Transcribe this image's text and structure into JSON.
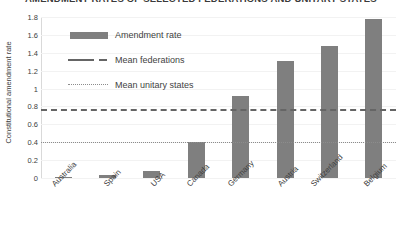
{
  "chart_data": {
    "type": "bar",
    "title": "AMENDMENT RATES OF SELECTED FEDERATIONS AND UNITARY STATES",
    "xlabel": "",
    "ylabel": "Constitutional amendment rate",
    "ylim": [
      0,
      1.8
    ],
    "ytick_labels": [
      "1.8",
      "1.6",
      "1.4",
      "1.2",
      "1",
      "0.8",
      "0.6",
      "0.4",
      "0.2",
      "0"
    ],
    "ytick_values": [
      1.8,
      1.6,
      1.4,
      1.2,
      1.0,
      0.8,
      0.6,
      0.4,
      0.2,
      0
    ],
    "grid": true,
    "legend_position": "upper-left-inside",
    "categories": [
      "Australia",
      "Spain",
      "USA",
      "Canada",
      "Germany",
      "Austria",
      "Switzerland",
      "Belgium"
    ],
    "values": [
      0.01,
      0.03,
      0.08,
      0.4,
      0.92,
      1.31,
      1.48,
      1.78
    ],
    "series": [
      {
        "name": "Amendment rate",
        "type": "bar",
        "color": "#7f7f7f",
        "values": [
          0.01,
          0.03,
          0.08,
          0.4,
          0.92,
          1.31,
          1.48,
          1.78
        ]
      },
      {
        "name": "Mean federations",
        "type": "hline",
        "style": "dashed",
        "color": "#656565",
        "value": 0.77
      },
      {
        "name": "Mean unitary states",
        "type": "hline",
        "style": "dotted",
        "color": "#8c8c8c",
        "value": 0.4
      }
    ],
    "legend": [
      {
        "label": "Amendment rate",
        "marker": "bar-swatch"
      },
      {
        "label": "Mean federations",
        "marker": "dashed-line"
      },
      {
        "label": "Mean unitary states",
        "marker": "dotted-line"
      }
    ]
  }
}
